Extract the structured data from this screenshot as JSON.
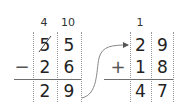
{
  "subtraction": {
    "borrow": {
      "tens": "4",
      "ones": "10"
    },
    "minuend": {
      "tens": "5",
      "ones": "5",
      "tens_struck": true
    },
    "operator": "−",
    "subtrahend": {
      "tens": "2",
      "ones": "6"
    },
    "result": {
      "tens": "2",
      "ones": "9"
    }
  },
  "addition": {
    "carry": {
      "tens": "1"
    },
    "addend1": {
      "tens": "2",
      "ones": "9"
    },
    "operator": "+",
    "addend2": {
      "tens": "1",
      "ones": "8"
    },
    "result": {
      "tens": "4",
      "ones": "7"
    }
  },
  "arrow": {
    "from": "subtraction.result",
    "to": "addition.addend1"
  },
  "colors": {
    "digit": "#222222",
    "grid": "#9a9a9a",
    "rule": "#6e6e6e",
    "arrow": "#777777"
  }
}
